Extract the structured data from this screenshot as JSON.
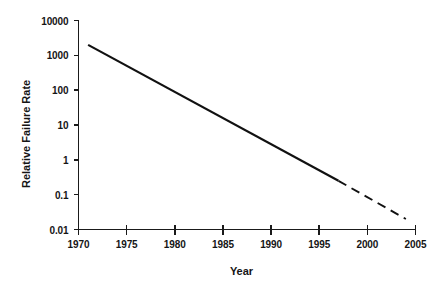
{
  "chart_data": {
    "type": "line",
    "title": "",
    "xlabel": "Year",
    "ylabel": "Relative Failure Rate",
    "xlim": [
      1970,
      2005
    ],
    "ylim": [
      0.01,
      10000
    ],
    "yscale": "log",
    "grid": false,
    "legend": "none",
    "xticks": [
      "1970",
      "1975",
      "1980",
      "1985",
      "1990",
      "1995",
      "2000",
      "2005"
    ],
    "xtick_values": [
      1970,
      1975,
      1980,
      1985,
      1990,
      1995,
      2000,
      2005
    ],
    "yticks": [
      "10000",
      "1000",
      "100",
      "10",
      "1",
      "0.1",
      "0.01"
    ],
    "ytick_values": [
      10000,
      1000,
      100,
      10,
      1,
      0.1,
      0.01
    ],
    "series": [
      {
        "name": "Relative failure rate (observed)",
        "style": "solid",
        "color": "#111111",
        "x": [
          1971,
          1997
        ],
        "values": [
          2000,
          0.25
        ]
      },
      {
        "name": "Relative failure rate (projected)",
        "style": "dashed",
        "color": "#111111",
        "x": [
          1997,
          2004
        ],
        "values": [
          0.25,
          0.02
        ]
      }
    ],
    "annotations": []
  },
  "axes": {
    "y_title": "Relative Failure Rate",
    "x_title": "Year"
  }
}
